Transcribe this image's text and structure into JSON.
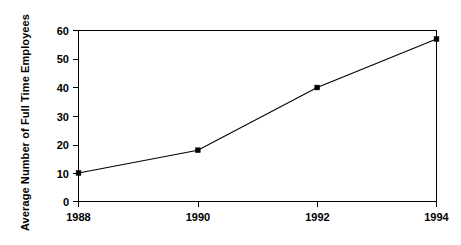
{
  "chart_data": {
    "type": "line",
    "title": "",
    "xlabel": "",
    "ylabel": "Average Number of Full Time Employees",
    "categories": [
      "1988",
      "1990",
      "1992",
      "1994"
    ],
    "x": [
      1988,
      1990,
      1992,
      1994
    ],
    "values": [
      10,
      18,
      40,
      57
    ],
    "series": [
      {
        "name": "Average Number of Full Time Employees",
        "values": [
          10,
          18,
          40,
          57
        ]
      }
    ],
    "ylim": [
      0,
      60
    ],
    "y_ticks": [
      0,
      10,
      20,
      30,
      40,
      50,
      60
    ],
    "y_tick_labels": [
      "0",
      "10",
      "20",
      "30",
      "40",
      "50",
      "60"
    ],
    "x_tick_labels": [
      "1988",
      "1990",
      "1992",
      "1994"
    ],
    "grid": false,
    "legend": false,
    "legend_position": "none",
    "marker": "square",
    "line_color": "#000000",
    "marker_color": "#000000",
    "background_color": "#ffffff",
    "axis_color": "#000000"
  }
}
